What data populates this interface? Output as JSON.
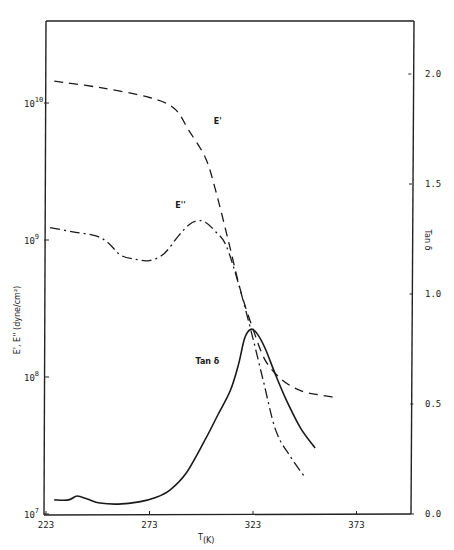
{
  "chart_data": {
    "type": "line",
    "title": "",
    "xlabel": "T(K)",
    "ylabel_left": "E', E'' (dyne/cm²)",
    "ylabel_right": "Tan δ",
    "x_range": [
      223,
      398
    ],
    "x_ticks": [
      223,
      273,
      323,
      373
    ],
    "y_left_scale": "log",
    "y_left_range": [
      10000000.0,
      100000000000.0
    ],
    "y_left_ticks": [
      {
        "label": "10",
        "exp": "10",
        "value": 10000000000.0
      },
      {
        "label": "10",
        "exp": "9",
        "value": 1000000000.0
      },
      {
        "label": "10",
        "exp": "8",
        "value": 100000000.0
      },
      {
        "label": "10",
        "exp": "7",
        "value": 10000000.0
      }
    ],
    "y_right_range": [
      0.0,
      2.2
    ],
    "y_right_ticks": [
      "0.0",
      "0.5",
      "1.0",
      "1.5",
      "2.0"
    ],
    "grid": false,
    "legend": "inline labels",
    "series": [
      {
        "name": "E'",
        "axis": "left",
        "style": "dashed",
        "x": [
          227,
          250,
          273,
          285,
          292,
          300,
          305,
          311,
          317,
          323,
          329,
          337,
          346,
          355,
          363
        ],
        "log10_y": [
          10.16,
          10.11,
          10.04,
          9.96,
          9.8,
          9.6,
          9.36,
          9.0,
          8.63,
          8.35,
          8.12,
          7.98,
          7.9,
          7.87,
          7.85
        ]
      },
      {
        "name": "E''",
        "axis": "left",
        "style": "dash-dot",
        "x": [
          225,
          236,
          247,
          253,
          259,
          266,
          273,
          280,
          287,
          292,
          296,
          300,
          305,
          310,
          316,
          322,
          328,
          334,
          341,
          348
        ],
        "log10_y": [
          9.09,
          9.06,
          9.03,
          8.98,
          8.89,
          8.86,
          8.85,
          8.9,
          9.03,
          9.11,
          9.14,
          9.13,
          9.06,
          8.96,
          8.68,
          8.34,
          7.97,
          7.61,
          7.42,
          7.27
        ]
      },
      {
        "name": "Tan δ",
        "axis": "right",
        "style": "solid",
        "x": [
          227,
          234,
          238,
          243,
          249,
          258,
          268,
          276,
          283,
          291,
          300,
          306,
          312,
          316,
          319,
          322,
          325,
          329,
          334,
          339,
          346,
          353
        ],
        "y": [
          0.064,
          0.064,
          0.082,
          0.068,
          0.05,
          0.045,
          0.055,
          0.075,
          0.11,
          0.19,
          0.34,
          0.45,
          0.56,
          0.68,
          0.8,
          0.84,
          0.82,
          0.75,
          0.63,
          0.52,
          0.39,
          0.3
        ]
      }
    ],
    "annotations": [
      {
        "text": "E'",
        "x": 306,
        "log10_y": 9.85
      },
      {
        "text": "E''",
        "x": 288,
        "log10_y": 9.23
      },
      {
        "text": "Tan δ",
        "x": 301,
        "tan": 0.68
      }
    ]
  }
}
